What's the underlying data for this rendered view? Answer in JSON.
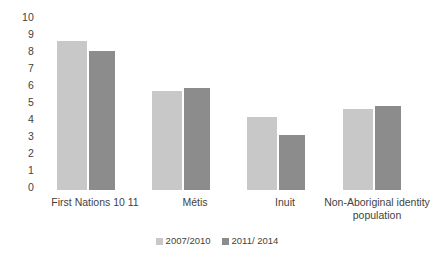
{
  "chart_data": {
    "type": "bar",
    "title": "",
    "subtitle": "",
    "xlabel": "",
    "ylabel": "",
    "ylim": [
      0,
      10
    ],
    "ytick_labels": [
      "10",
      "9",
      "8",
      "7",
      "6",
      "5",
      "4",
      "3",
      "2",
      "1",
      "0"
    ],
    "grid": false,
    "legend_position": "bottom-center",
    "categories": [
      "First Nations 10 11",
      "Métis",
      "Inuit",
      "Non-Aboriginal identity population"
    ],
    "series": [
      {
        "name": "2007/2010",
        "color": "#c8c8c8",
        "values": [
          8.75,
          5.8,
          4.3,
          4.75
        ]
      },
      {
        "name": "2011/ 2014",
        "color": "#8c8c8c",
        "values": [
          8.2,
          6.0,
          3.25,
          4.95
        ]
      }
    ]
  },
  "legend": {
    "items": [
      {
        "label": "2007/2010",
        "swatch": "legend-swatch-2007-2010"
      },
      {
        "label": "2011/ 2014",
        "swatch": "legend-swatch-2011-2014"
      }
    ]
  }
}
